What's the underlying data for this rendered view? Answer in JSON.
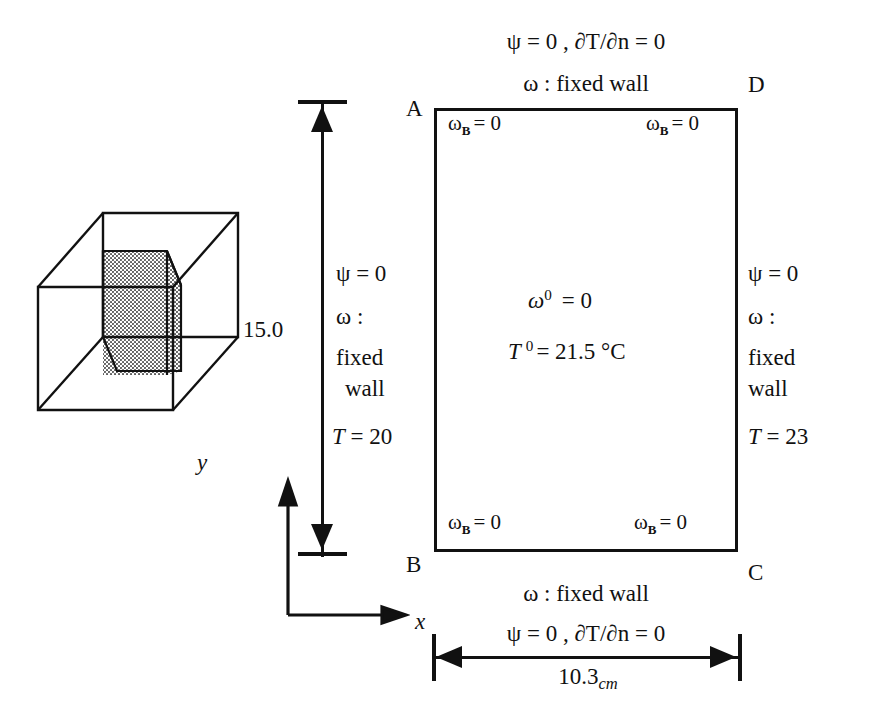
{
  "figure": {
    "type": "boundary-condition-diagram",
    "cavity": {
      "corner_labels": {
        "top_left": "A",
        "top_right": "D",
        "bottom_left": "B",
        "bottom_right": "C"
      },
      "corner_vorticity": {
        "top_left": "ω",
        "top_left_sub": "B",
        "top_left_value": "= 0",
        "top_right": "ω",
        "top_right_sub": "B",
        "top_right_value": "= 0",
        "bottom_left": "ω",
        "bottom_left_sub": "B",
        "bottom_left_value": "= 0",
        "bottom_right": "ω",
        "bottom_right_sub": "B",
        "bottom_right_value": "= 0"
      },
      "interior": {
        "vorticity_symbol": "ω",
        "vorticity_sup": "0",
        "vorticity_value": "=  0",
        "temperature_symbol": "T",
        "temperature_sup": "0",
        "temperature_value": "= 21.5 °C"
      }
    },
    "top_boundary": {
      "line1": "ψ = 0 ,  ∂T/∂n = 0",
      "line2": "ω : fixed wall"
    },
    "bottom_boundary": {
      "line1": "ω : fixed wall",
      "line2": "ψ = 0 ,  ∂T/∂n = 0"
    },
    "left_boundary": {
      "psi": "ψ = 0",
      "omega": "ω :",
      "fixed": "fixed",
      "wall": "wall",
      "temperature": "T = 20"
    },
    "right_boundary": {
      "psi": "ψ = 0",
      "omega": "ω :",
      "fixed": "fixed",
      "wall": "wall",
      "temperature": "T = 23"
    },
    "dimensions": {
      "height_label": "15.0",
      "width_value": "10.3",
      "width_unit": "cm"
    },
    "axes": {
      "x_label": "x",
      "y_label": "y"
    },
    "enclosure_3d": {
      "name": "rectangular enclosure with shaded cross-sectional plane",
      "shading": "stippled-grey"
    }
  },
  "colors": {
    "ink": "#111111",
    "background": "#ffffff",
    "hatch": "#9a9a9a"
  }
}
